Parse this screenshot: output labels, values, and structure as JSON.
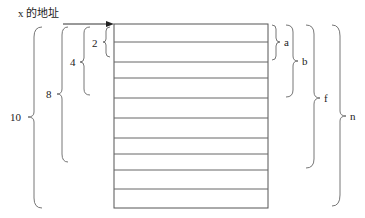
{
  "pointer_label": "x 的地址",
  "rows": 10,
  "left_braces": [
    {
      "label": "2",
      "rows": 1
    },
    {
      "label": "4",
      "rows": 3
    },
    {
      "label": "8",
      "rows": 7
    },
    {
      "label": "10",
      "rows": 10
    }
  ],
  "right_braces": [
    {
      "label": "a",
      "rows": 2
    },
    {
      "label": "b",
      "rows": 4
    },
    {
      "label": "f",
      "rows": 8
    },
    {
      "label": "n",
      "rows": 10
    }
  ],
  "colors": {
    "line": "#555555",
    "text": "#222222"
  }
}
